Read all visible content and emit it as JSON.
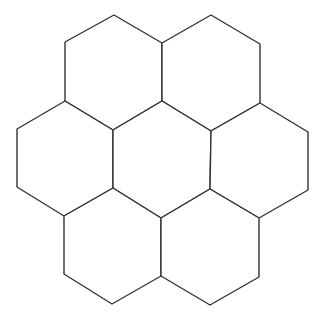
{
  "caption": "",
  "diagram": {
    "type": "hexagonal-tiling",
    "hexagon_count": 7,
    "stroke_color": "#333333",
    "fill_color": "#ffffff",
    "background": "#ffffff",
    "hexagons": [
      {
        "id": "top-left",
        "points": "114,15 162,43 162,101 113,130 65,101 65,42"
      },
      {
        "id": "top-right",
        "points": "211,15 260,44 260,103 211,131 162,101 162,43"
      },
      {
        "id": "middle-left",
        "points": "65,101 113,130 113,188 64,216 17,187 17,129"
      },
      {
        "id": "center",
        "points": "162,101 211,131 210,189 161,218 113,188 113,130"
      },
      {
        "id": "middle-right",
        "points": "260,103 308,132 308,190 259,218 210,189 211,131"
      },
      {
        "id": "bottom-left",
        "points": "113,188 161,218 161,276 112,304 64,274 64,216"
      },
      {
        "id": "bottom-right",
        "points": "210,189 259,218 259,277 210,305 161,276 161,218"
      }
    ]
  }
}
